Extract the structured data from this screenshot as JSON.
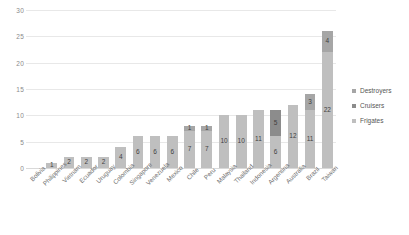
{
  "chart_data": {
    "type": "bar",
    "subtype": "stacked-bar",
    "title": "",
    "xlabel": "",
    "ylabel": "",
    "ylim": [
      0,
      30
    ],
    "yticks": [
      0,
      5,
      10,
      15,
      20,
      25,
      30
    ],
    "grid": true,
    "legend_position": "right",
    "categories": [
      "Bolivia",
      "Philippines",
      "Vietnam",
      "Ecuador",
      "Uruguay",
      "Colombia",
      "Singapore",
      "Venezuela",
      "Mexico",
      "Chile",
      "Peru",
      "Malaysia",
      "Thailand",
      "Indonesia",
      "Argentina",
      "Australia",
      "Brazil",
      "Taiwan"
    ],
    "series": [
      {
        "name": "Frigates",
        "color": "#bfbfbf",
        "values": [
          0,
          1,
          2,
          2,
          2,
          4,
          6,
          6,
          6,
          7,
          7,
          10,
          10,
          11,
          6,
          12,
          11,
          22
        ]
      },
      {
        "name": "Cruisers",
        "color": "#8c8c8c",
        "values": [
          0,
          0,
          0,
          0,
          0,
          0,
          0,
          0,
          0,
          0,
          0,
          0,
          0,
          0,
          5,
          0,
          0,
          0
        ]
      },
      {
        "name": "Destroyers",
        "color": "#a6a6a6",
        "values": [
          0,
          0,
          0,
          0,
          0,
          0,
          0,
          0,
          0,
          1,
          1,
          0,
          0,
          0,
          0,
          0,
          3,
          4
        ]
      }
    ],
    "totals": [
      0,
      1,
      2,
      2,
      2,
      4,
      6,
      6,
      6,
      8,
      8,
      10,
      10,
      11,
      11,
      12,
      14,
      26
    ]
  },
  "legend": {
    "items": [
      {
        "label": "Destroyers",
        "color": "#a6a6a6"
      },
      {
        "label": "Cruisers",
        "color": "#8c8c8c"
      },
      {
        "label": "Frigates",
        "color": "#bfbfbf"
      }
    ]
  }
}
